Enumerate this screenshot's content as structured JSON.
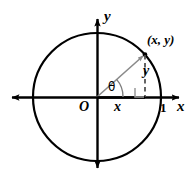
{
  "figure": {
    "type": "geometry-diagram",
    "background_color": "#ffffff",
    "stroke_color": "#000000",
    "radius_color": "#8a8a8a",
    "dashed_color": "#555555"
  },
  "labels": {
    "y_axis": "y",
    "x_axis": "x",
    "origin": "O",
    "unit_tick": "1",
    "point": "(x, y)",
    "leg_horizontal": "x",
    "leg_vertical": "y",
    "angle": "θ"
  },
  "geometry": {
    "center": {
      "x": 97,
      "y": 97
    },
    "radius": 64,
    "point_on_circle": {
      "x": 145,
      "y": 55
    },
    "foot_of_perpendicular": {
      "x": 145,
      "y": 97
    },
    "unit_tick_position": {
      "x": 161,
      "y": 97
    },
    "angle_arc_radius": 26,
    "angle_degrees": 41,
    "x_axis_arrow_left": {
      "x": 5,
      "y": 97
    },
    "x_axis_arrow_right": {
      "x": 172,
      "y": 97
    },
    "y_axis_arrow_top": {
      "x": 97,
      "y": 12
    },
    "y_axis_arrow_bottom": {
      "x": 97,
      "y": 175
    },
    "right_angle_marker_size": 9
  }
}
